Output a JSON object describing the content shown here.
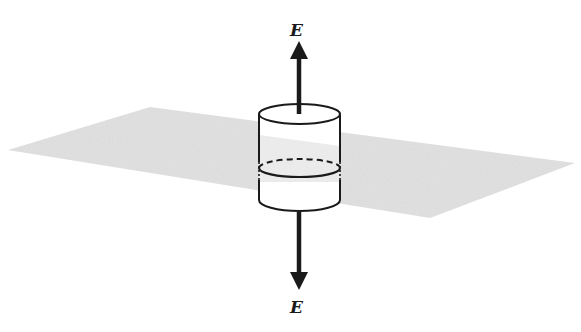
{
  "diagram": {
    "labels": {
      "field_top": "E",
      "field_bottom": "E"
    },
    "colors": {
      "plane": "#d9d9d9",
      "stroke": "#1a1a1a",
      "background": "#ffffff"
    }
  }
}
